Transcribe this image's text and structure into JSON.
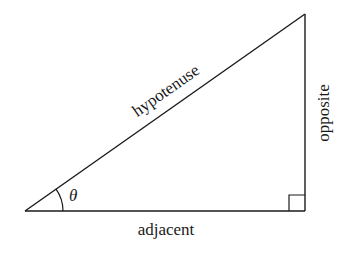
{
  "diagram": {
    "type": "right-triangle",
    "background": "#ffffff",
    "stroke_color": "#1a1a1a",
    "vertices": {
      "angle_vertex": [
        25,
        211
      ],
      "right_angle_vertex": [
        305,
        211
      ],
      "top_vertex": [
        305,
        14
      ]
    },
    "labels": {
      "hypotenuse": "hypotenuse",
      "opposite": "opposite",
      "adjacent": "adjacent",
      "angle": "θ"
    },
    "right_angle_marker_size": 16,
    "angle_arc_radius": 38
  }
}
